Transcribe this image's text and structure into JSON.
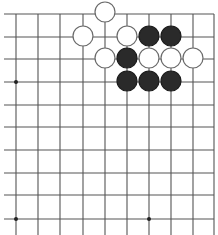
{
  "board": {
    "description": "Go board fragment (upper-left region of a larger board)",
    "colors": {
      "background": "#ffffff",
      "line": "#555555",
      "black_stone": "#2a2a2a",
      "white_stone_fill": "#ffffff",
      "stone_outline": "#6a6a6a"
    },
    "columns_x": [
      16,
      38,
      60,
      83,
      105,
      127,
      149,
      171,
      193,
      214
    ],
    "rows_y": [
      14,
      37,
      59,
      82,
      105,
      127,
      150,
      173,
      195,
      219
    ],
    "right_edge_col": 9,
    "top_edge_row": 0,
    "star_points": [
      {
        "col": 0,
        "row": 3
      },
      {
        "col": 0,
        "row": 9
      },
      {
        "col": 6,
        "row": 9
      }
    ],
    "stones": [
      {
        "color": "white",
        "col": 4,
        "row": 0
      },
      {
        "color": "white",
        "col": 3,
        "row": 1
      },
      {
        "color": "white",
        "col": 5,
        "row": 1
      },
      {
        "color": "black",
        "col": 6,
        "row": 1
      },
      {
        "color": "black",
        "col": 7,
        "row": 1
      },
      {
        "color": "white",
        "col": 4,
        "row": 2
      },
      {
        "color": "black",
        "col": 5,
        "row": 2
      },
      {
        "color": "white",
        "col": 6,
        "row": 2
      },
      {
        "color": "white",
        "col": 7,
        "row": 2
      },
      {
        "color": "white",
        "col": 8,
        "row": 2
      },
      {
        "color": "black",
        "col": 5,
        "row": 3
      },
      {
        "color": "black",
        "col": 6,
        "row": 3
      },
      {
        "color": "black",
        "col": 7,
        "row": 3
      }
    ],
    "stone_radius": 10
  }
}
